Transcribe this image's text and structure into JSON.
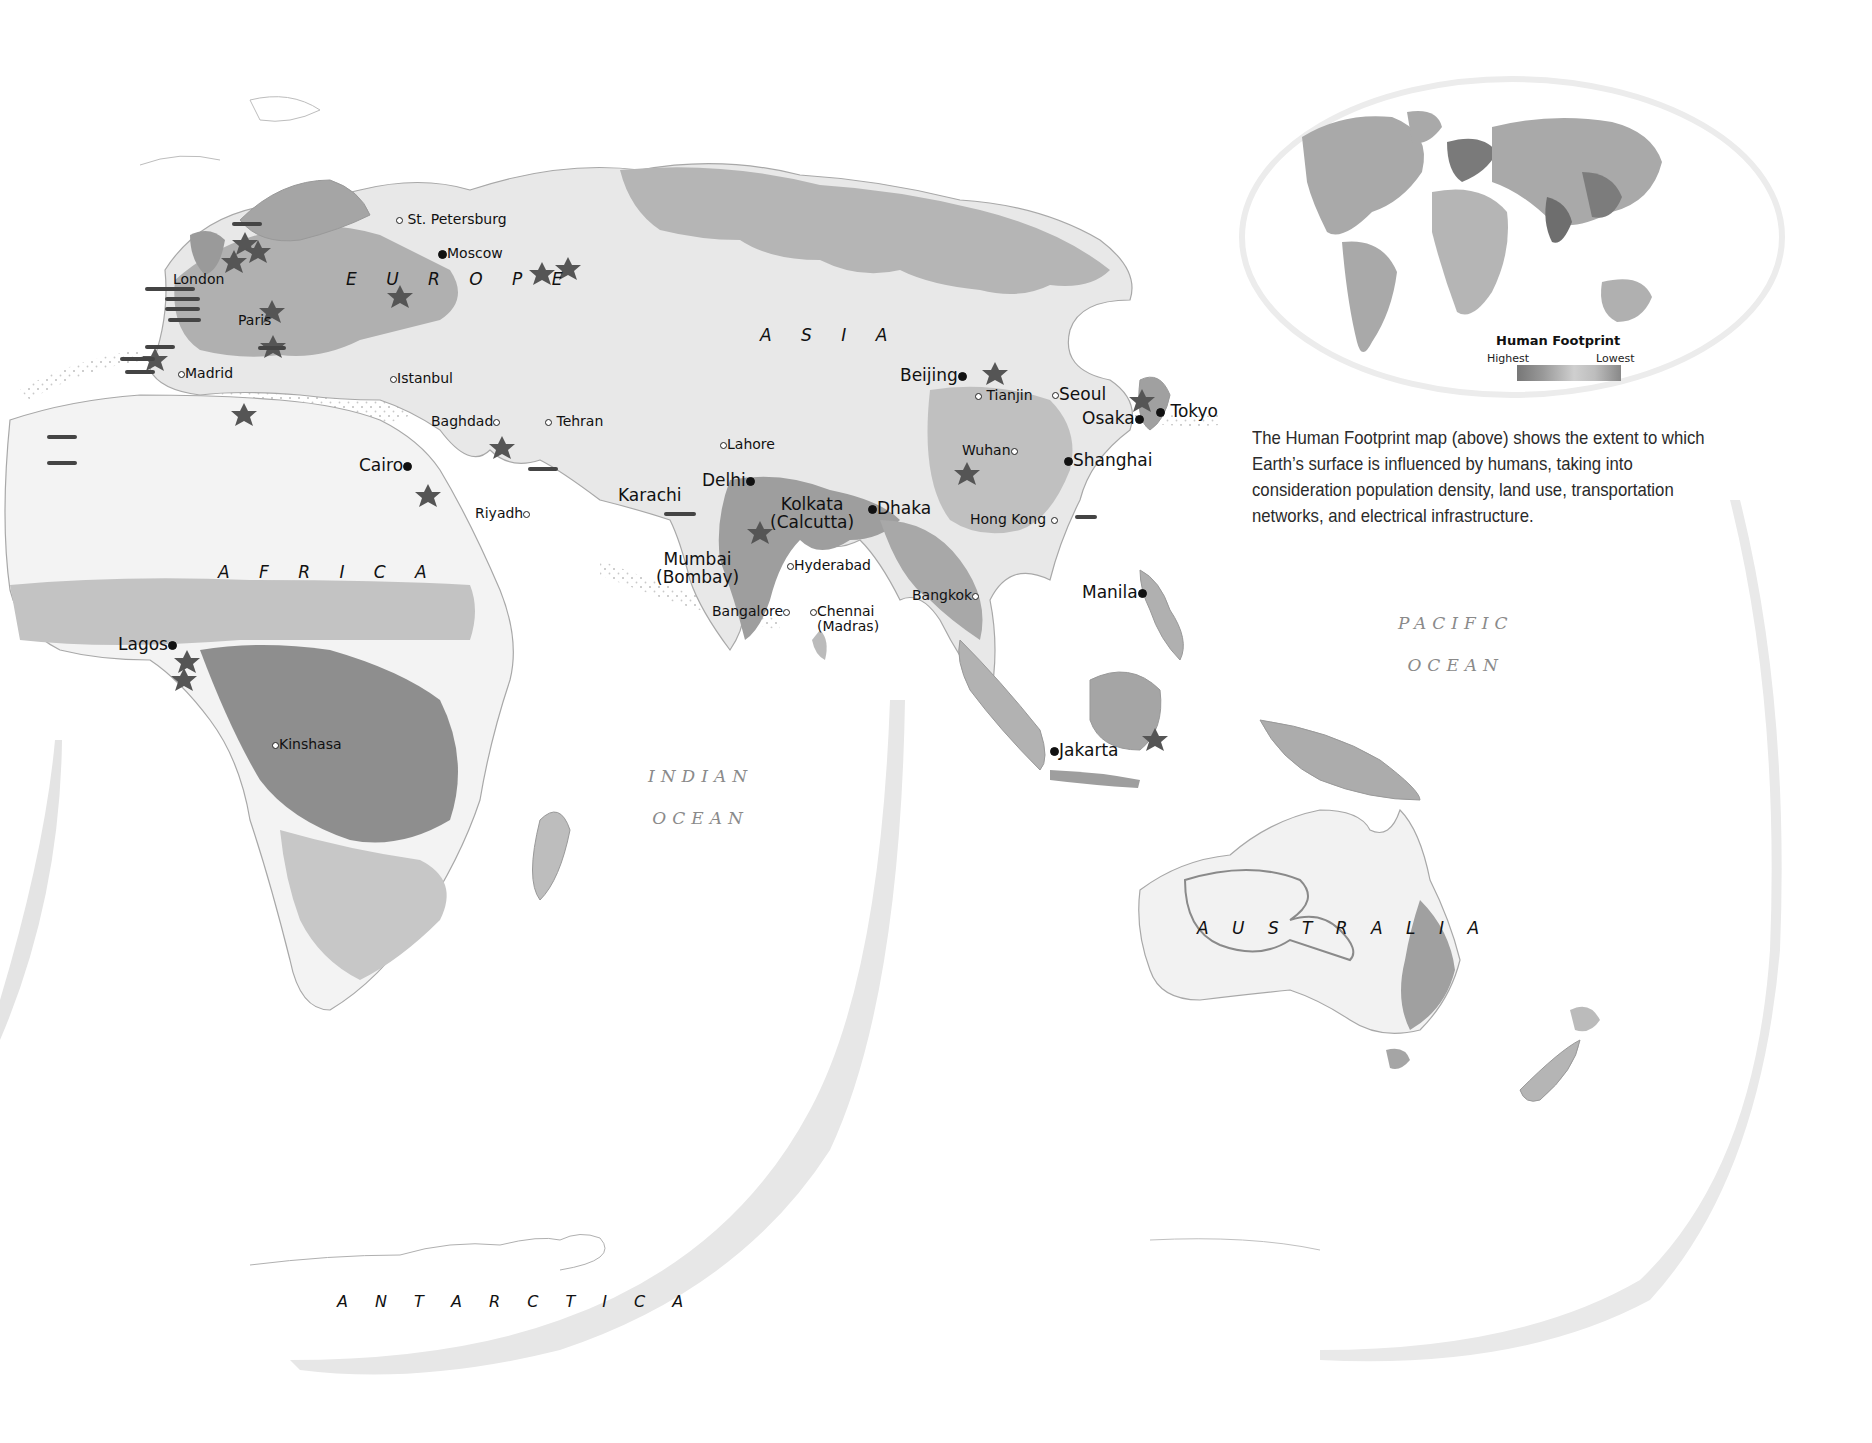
{
  "map": {
    "title": "Human Footprint",
    "projection_style": "interrupted world map (Eastern Hemisphere lobe)",
    "continents": [
      {
        "id": "europe",
        "label": "E U R O P E"
      },
      {
        "id": "asia",
        "label": "A S I A"
      },
      {
        "id": "africa",
        "label": "A F R I C A"
      },
      {
        "id": "australia",
        "label": "A U S T R A L I A"
      },
      {
        "id": "antarctica",
        "label": "A N T A R C T I C A"
      }
    ],
    "oceans": [
      {
        "id": "indian",
        "line1": "INDIAN",
        "line2": "OCEAN"
      },
      {
        "id": "pacific",
        "line1": "PACIFIC",
        "line2": "OCEAN"
      }
    ],
    "cities": [
      {
        "name": "St. Petersburg",
        "marker": "open",
        "size": "minor"
      },
      {
        "name": "Moscow",
        "marker": "filled",
        "size": "minor"
      },
      {
        "name": "London",
        "marker": "open",
        "size": "minor"
      },
      {
        "name": "Paris",
        "marker": "open",
        "size": "minor"
      },
      {
        "name": "Madrid",
        "marker": "open",
        "size": "minor"
      },
      {
        "name": "Istanbul",
        "marker": "open",
        "size": "minor"
      },
      {
        "name": "Baghdad",
        "marker": "open",
        "size": "minor"
      },
      {
        "name": "Tehran",
        "marker": "open",
        "size": "minor"
      },
      {
        "name": "Cairo",
        "marker": "filled",
        "size": "major"
      },
      {
        "name": "Riyadh",
        "marker": "open",
        "size": "minor"
      },
      {
        "name": "Lahore",
        "marker": "open",
        "size": "minor"
      },
      {
        "name": "Delhi",
        "marker": "filled",
        "size": "major"
      },
      {
        "name": "Karachi",
        "marker": "filled",
        "size": "major"
      },
      {
        "name": "Kolkata",
        "alt": "(Calcutta)",
        "marker": "filled",
        "size": "major"
      },
      {
        "name": "Dhaka",
        "marker": "filled",
        "size": "major"
      },
      {
        "name": "Mumbai",
        "alt": "(Bombay)",
        "marker": "filled",
        "size": "major"
      },
      {
        "name": "Hyderabad",
        "marker": "open",
        "size": "minor"
      },
      {
        "name": "Bangalore",
        "marker": "open",
        "size": "minor"
      },
      {
        "name": "Chennai",
        "alt": "(Madras)",
        "marker": "open",
        "size": "minor"
      },
      {
        "name": "Bangkok",
        "marker": "open",
        "size": "minor"
      },
      {
        "name": "Beijing",
        "marker": "filled",
        "size": "major"
      },
      {
        "name": "Tianjin",
        "marker": "open",
        "size": "minor"
      },
      {
        "name": "Seoul",
        "marker": "open",
        "size": "major"
      },
      {
        "name": "Osaka",
        "marker": "filled",
        "size": "major"
      },
      {
        "name": "Tokyo",
        "marker": "filled",
        "size": "major"
      },
      {
        "name": "Wuhan",
        "marker": "open",
        "size": "minor"
      },
      {
        "name": "Shanghai",
        "marker": "filled",
        "size": "major"
      },
      {
        "name": "Hong Kong",
        "marker": "open",
        "size": "minor"
      },
      {
        "name": "Manila",
        "marker": "filled",
        "size": "major"
      },
      {
        "name": "Jakarta",
        "marker": "filled",
        "size": "major"
      },
      {
        "name": "Lagos",
        "marker": "filled",
        "size": "major"
      },
      {
        "name": "Kinshasa",
        "marker": "open",
        "size": "minor"
      }
    ],
    "symbols": {
      "conflict": "star-burst-icon",
      "shipping": "ship-icon"
    },
    "colors": {
      "land_light": "#e6e6e6",
      "land_mid": "#b9b9b9",
      "land_dark": "#8f8f8f",
      "land_darkest": "#6e6e6e",
      "ocean": "#ffffff",
      "border": "#9a9a9a"
    }
  },
  "inset": {
    "title": "Human Footprint",
    "legend_high": "Highest",
    "legend_low": "Lowest"
  },
  "caption": "The Human Footprint map (above) shows the extent to which Earth’s surface is influenced by humans, taking into consideration population density, land use, transportation networks, and electrical infrastructure."
}
